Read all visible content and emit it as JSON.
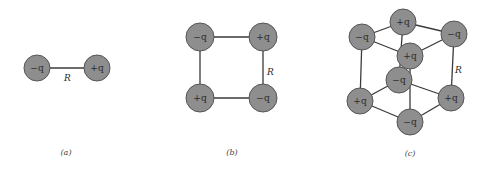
{
  "figure": {
    "panels": [
      {
        "id": "a",
        "caption": "(a)",
        "distance_label": "R",
        "charges": [
          {
            "label": "−q",
            "x": 37,
            "y": 68
          },
          {
            "label": "+q",
            "x": 97,
            "y": 68
          }
        ]
      },
      {
        "id": "b",
        "caption": "(b)",
        "distance_label": "R",
        "charges": [
          {
            "label": "−q",
            "x": 200,
            "y": 37
          },
          {
            "label": "+q",
            "x": 263,
            "y": 37
          },
          {
            "label": "+q",
            "x": 200,
            "y": 98
          },
          {
            "label": "−q",
            "x": 263,
            "y": 98
          }
        ]
      },
      {
        "id": "c",
        "caption": "(c)",
        "distance_label": "R",
        "charges": [
          {
            "label": "+q",
            "x": 403,
            "y": 22
          },
          {
            "label": "−q",
            "x": 362,
            "y": 37
          },
          {
            "label": "−q",
            "x": 454,
            "y": 34
          },
          {
            "label": "+q",
            "x": 410,
            "y": 56
          },
          {
            "label": "−q",
            "x": 399,
            "y": 80
          },
          {
            "label": "+q",
            "x": 360,
            "y": 101
          },
          {
            "label": "+q",
            "x": 451,
            "y": 98
          },
          {
            "label": "−q",
            "x": 410,
            "y": 122
          }
        ]
      }
    ],
    "colors": {
      "charge_fill": "#8e8e8e",
      "charge_stroke": "#555555",
      "line": "#3a3a3a",
      "background": "#ffffff"
    }
  }
}
